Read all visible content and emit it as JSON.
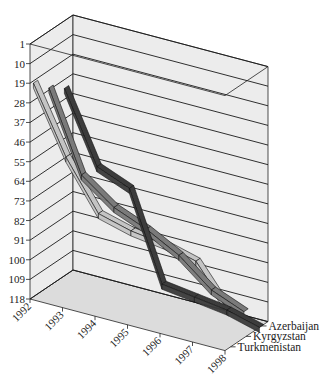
{
  "chart_data": {
    "type": "line",
    "style": "3d",
    "title": "",
    "xlabel": "",
    "ylabel": "",
    "categories": [
      "1992",
      "1993",
      "1994",
      "1995",
      "1996",
      "1997",
      "1998"
    ],
    "y_ticks": [
      1,
      10,
      19,
      28,
      37,
      46,
      55,
      64,
      73,
      82,
      91,
      100,
      109,
      118
    ],
    "ylim": [
      1,
      118
    ],
    "y_inverted": true,
    "grid": true,
    "legend": "depth-axis labels (right)",
    "series": [
      {
        "name": "Azerbaijan",
        "color": "#3c3c3c",
        "values": [
          32,
          64,
          70,
          110,
          112,
          114,
          118
        ]
      },
      {
        "name": "Kyrgyzstan",
        "color": "#7a7a7a",
        "values": [
          27,
          63,
          74,
          80,
          88,
          100,
          106
        ]
      },
      {
        "name": "Turkmenistan",
        "color": "#c4c4c4",
        "values": [
          20,
          50,
          72,
          76,
          78,
          82,
          101
        ]
      }
    ],
    "colors": {
      "wall": "#ececec",
      "floor": "#dcdcdc",
      "gridline": "#1a1a1a"
    }
  }
}
